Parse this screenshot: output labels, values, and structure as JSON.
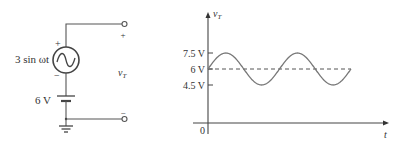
{
  "circuit": {
    "source_label": "3 sin ωt",
    "source_plus": "+",
    "source_minus": "−",
    "battery_label": "6 V",
    "terminal_plus": "+",
    "terminal_minus": "−",
    "output_label_main": "v",
    "output_label_sub": "T"
  },
  "chart_data": {
    "type": "line",
    "title": "",
    "xlabel": "t",
    "ylabel_main": "v",
    "ylabel_sub": "T",
    "origin_label": "0",
    "yticks": [
      {
        "value": 7.5,
        "label": "7.5 V"
      },
      {
        "value": 6,
        "label": "6 V"
      },
      {
        "value": 4.5,
        "label": "4.5 V"
      }
    ],
    "ylim": [
      0,
      10
    ],
    "dc_level": 6,
    "amplitude": 3,
    "peak": 7.5,
    "trough": 4.5,
    "cycles": 2,
    "series": [
      {
        "name": "vT",
        "function": "6 + 1.5*sin(wt)",
        "style": "solid"
      },
      {
        "name": "dc-level",
        "value": 6,
        "style": "dashed"
      }
    ]
  }
}
